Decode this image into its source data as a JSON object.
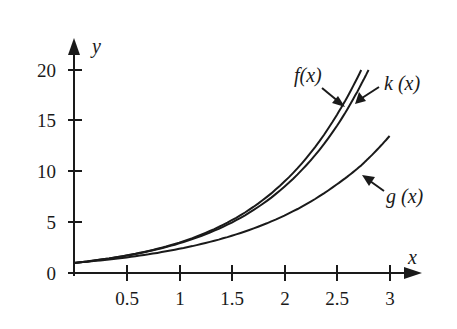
{
  "chart_data": {
    "type": "line",
    "title": "",
    "xlabel": "x",
    "ylabel": "y",
    "xlim": [
      0,
      3.2
    ],
    "ylim": [
      0,
      21
    ],
    "grid": false,
    "legend_position": "inline annotations with arrows",
    "x_ticks": [
      0.5,
      1,
      1.5,
      2,
      2.5,
      3
    ],
    "x_tick_labels": [
      "0.5",
      "1",
      "1.5",
      "2",
      "2.5",
      "3"
    ],
    "y_ticks": [
      0,
      5,
      10,
      15,
      20
    ],
    "y_tick_labels": [
      "0",
      "5",
      "10",
      "15",
      "20"
    ],
    "x": [
      0,
      0.5,
      1,
      1.5,
      2,
      2.5,
      2.73,
      2.8,
      3
    ],
    "series": [
      {
        "name": "f(x)",
        "x_end": 2.73,
        "values": [
          1,
          1.73,
          3.0,
          5.2,
          9.0,
          15.6,
          20.0,
          null,
          null
        ]
      },
      {
        "name": "k(x)",
        "x_end": 2.8,
        "values": [
          1,
          1.71,
          2.92,
          4.97,
          8.5,
          14.5,
          18.6,
          20.0,
          null
        ]
      },
      {
        "name": "g(x)",
        "x_end": 3.0,
        "values": [
          1,
          1.54,
          2.38,
          3.67,
          5.66,
          8.74,
          10.6,
          11.3,
          13.5
        ]
      }
    ],
    "annotations": [
      {
        "text": "f(x)",
        "points_to": "f(x) curve near x≈2.6"
      },
      {
        "text": "k(x)",
        "points_to": "k(x) curve near x≈2.65"
      },
      {
        "text": "g(x)",
        "points_to": "g(x) curve near x≈2.75"
      }
    ]
  },
  "labels": {
    "x_axis": "x",
    "y_axis": "y",
    "f": "f(x)",
    "k": "k (x)",
    "g": "g (x)"
  },
  "ticks": {
    "x": [
      "0.5",
      "1",
      "1.5",
      "2",
      "2.5",
      "3"
    ],
    "y": [
      "0",
      "5",
      "10",
      "15",
      "20"
    ]
  },
  "colors": {
    "ink": "#1a1a1a",
    "background": "#ffffff"
  }
}
